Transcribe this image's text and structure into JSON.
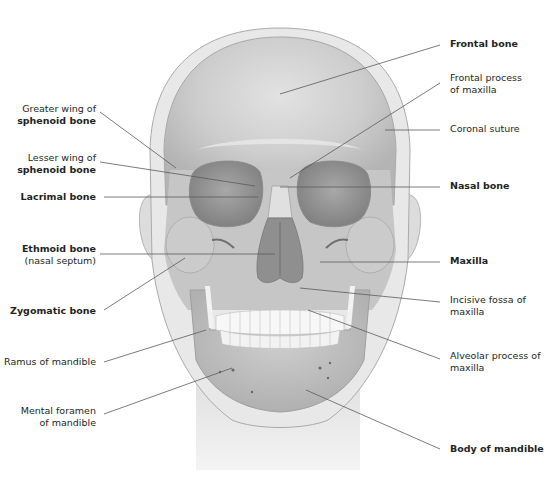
{
  "diagram": {
    "colors": {
      "background": "#ffffff",
      "skull_fill": "#c9c9c9",
      "skull_light": "#dedede",
      "head_outline_fill": "#e6e6e6",
      "orbit_fill": "#9a9a9a",
      "nasal_cavity_fill": "#8a8a8a",
      "teeth_fill": "#f7f7f7",
      "leader_line": "#555555",
      "label_text": "#231f20"
    }
  },
  "labels_left": [
    {
      "id": "greater-wing",
      "line1": "Greater wing of",
      "line2": "sphenoid bone",
      "bold_line": 2
    },
    {
      "id": "lesser-wing",
      "line1": "Lesser wing of",
      "line2": "sphenoid bone",
      "bold_line": 2
    },
    {
      "id": "lacrimal",
      "line1": "Lacrimal bone",
      "bold_line": 1
    },
    {
      "id": "ethmoid",
      "line1": "Ethmoid bone",
      "line2": "(nasal septum)",
      "bold_line": 1
    },
    {
      "id": "zygomatic",
      "line1": "Zygomatic bone",
      "bold_line": 1
    },
    {
      "id": "ramus",
      "line1": "Ramus of mandible",
      "bold_line": 0
    },
    {
      "id": "mental-foramen",
      "line1": "Mental foramen",
      "line2": "of mandible",
      "bold_line": 0
    }
  ],
  "labels_right": [
    {
      "id": "frontal",
      "line1": "Frontal bone",
      "bold_line": 1
    },
    {
      "id": "frontal-process",
      "line1": "Frontal process",
      "line2": "of maxilla",
      "bold_line": 0
    },
    {
      "id": "coronal-suture",
      "line1": "Coronal suture",
      "bold_line": 0
    },
    {
      "id": "nasal",
      "line1": "Nasal bone",
      "bold_line": 1
    },
    {
      "id": "maxilla",
      "line1": "Maxilla",
      "bold_line": 1
    },
    {
      "id": "incisive-fossa",
      "line1": "Incisive fossa of",
      "line2": "maxilla",
      "bold_line": 0
    },
    {
      "id": "alveolar-process",
      "line1": "Alveolar process of",
      "line2": "maxilla",
      "bold_line": 0
    },
    {
      "id": "body-mandible",
      "line1": "Body of mandible",
      "bold_line": 1
    }
  ]
}
